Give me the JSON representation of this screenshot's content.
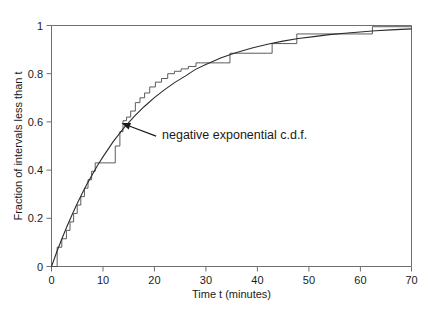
{
  "chart_data": {
    "type": "line",
    "title": "",
    "xlabel": "Time t (minutes)",
    "ylabel": "Fraction of intervals less than t",
    "xlim": [
      0,
      70
    ],
    "ylim": [
      0,
      1
    ],
    "grid": false,
    "legend": "none",
    "xticks": [
      0,
      10,
      20,
      30,
      40,
      50,
      60,
      70
    ],
    "xticklabels": [
      "0",
      "10",
      "20",
      "30",
      "40",
      "50",
      "60",
      "70"
    ],
    "yticks": [
      0,
      0.2,
      0.4,
      0.6,
      0.8,
      1
    ],
    "yticklabels": [
      "0",
      "0.2",
      "0.4",
      "0.6",
      "0.8",
      "1"
    ],
    "annotations": [
      {
        "text": "negative exponential c.d.f.",
        "text_x": 21.5,
        "text_y": 0.545,
        "arrow_tip_x": 13.6,
        "arrow_tip_y": 0.595
      }
    ],
    "series": [
      {
        "name": "negative exponential c.d.f.",
        "type": "line",
        "style": "smooth",
        "color": "#2b2b2b",
        "mean": 16.5,
        "formula": "F(t) = 1 - exp(-t/16.5)",
        "x": [
          0,
          1,
          2,
          3,
          4,
          5,
          6,
          7,
          8,
          9,
          10,
          12,
          14,
          16,
          18,
          20,
          22,
          24,
          26,
          28,
          30,
          33,
          36,
          39,
          42,
          45,
          48,
          51,
          54,
          57,
          60,
          63,
          66,
          70
        ],
        "y": [
          0,
          0.059,
          0.114,
          0.166,
          0.215,
          0.261,
          0.305,
          0.346,
          0.384,
          0.421,
          0.455,
          0.518,
          0.573,
          0.621,
          0.663,
          0.701,
          0.734,
          0.764,
          0.79,
          0.818,
          0.838,
          0.866,
          0.888,
          0.907,
          0.922,
          0.935,
          0.946,
          0.954,
          0.962,
          0.968,
          0.973,
          0.978,
          0.982,
          0.986
        ]
      },
      {
        "name": "empirical c.d.f. (observed intervals)",
        "type": "step",
        "style": "staircase",
        "color": "#4a4a4a",
        "step_x": [
          0,
          1.1,
          2.0,
          2.9,
          3.6,
          4.3,
          5.0,
          5.7,
          6.4,
          7.1,
          7.8,
          8.5,
          9.2,
          10.2,
          11.2,
          12.4,
          13.3,
          13.9,
          14.6,
          15.4,
          16.3,
          17.2,
          18.1,
          19.1,
          20.2,
          21.4,
          22.6,
          23.9,
          25.2,
          26.6,
          28.1,
          29.0,
          33.8,
          34.7,
          42.0,
          42.9,
          46.8,
          47.7,
          61.5,
          62.4,
          70.0
        ],
        "step_y": [
          0,
          0.08,
          0.115,
          0.15,
          0.185,
          0.22,
          0.255,
          0.29,
          0.325,
          0.36,
          0.395,
          0.43,
          0.43,
          0.43,
          0.43,
          0.5,
          0.56,
          0.605,
          0.62,
          0.645,
          0.68,
          0.7,
          0.72,
          0.745,
          0.765,
          0.78,
          0.8,
          0.81,
          0.82,
          0.83,
          0.845,
          0.845,
          0.845,
          0.885,
          0.885,
          0.925,
          0.925,
          0.965,
          0.965,
          0.995,
          0.995
        ]
      }
    ]
  },
  "axes": {
    "y_axis_label": "Fraction of intervals less than t",
    "x_axis_label": "Time t (minutes)"
  }
}
